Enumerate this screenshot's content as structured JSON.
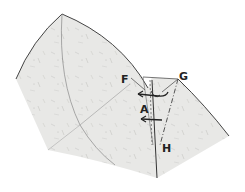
{
  "diagram": {
    "type": "origami-step",
    "paper_color": "#e9e9e7",
    "line_color": "#444444",
    "labels": {
      "F": "F",
      "G": "G",
      "A": "A",
      "H": "H"
    },
    "arrows": [
      {
        "name": "upper-fold-arrow",
        "direction": "left"
      },
      {
        "name": "lower-fold-arrow",
        "direction": "left"
      }
    ],
    "lines": {
      "valley_fold": "dashed",
      "mountain_fold": "dash-dot"
    }
  }
}
